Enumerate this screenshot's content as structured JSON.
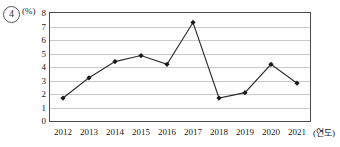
{
  "item": {
    "number": "4"
  },
  "axis": {
    "unit_label": "(%)",
    "x_title": "(연도)"
  },
  "chart_data": {
    "type": "line",
    "title": "",
    "xlabel": "(연도)",
    "ylabel": "(%)",
    "categories": [
      "2012",
      "2013",
      "2014",
      "2015",
      "2016",
      "2017",
      "2018",
      "2019",
      "2020",
      "2021"
    ],
    "values": [
      1.7,
      3.2,
      4.4,
      4.85,
      4.2,
      7.3,
      1.7,
      2.1,
      4.2,
      2.8
    ],
    "ylim": [
      0,
      8
    ],
    "yticks": [
      0,
      1,
      2,
      3,
      4,
      5,
      6,
      7,
      8
    ],
    "ytick_labels": [
      "0",
      "1",
      "2",
      "3",
      "4",
      "5",
      "6",
      "7",
      "8"
    ],
    "grid": true,
    "grid_axis": "y",
    "legend": false,
    "marker": "diamond",
    "line_color": "#2b2b2b",
    "marker_color": "#1a1a1a"
  }
}
